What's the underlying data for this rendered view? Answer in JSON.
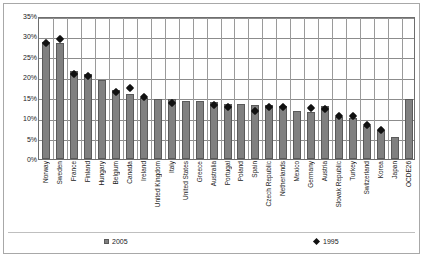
{
  "chart_data": {
    "type": "bar",
    "title": "",
    "xlabel": "",
    "ylabel": "",
    "ylim": [
      0,
      35
    ],
    "ytick_labels": [
      "0%",
      "5%",
      "10%",
      "15%",
      "20%",
      "25%",
      "30%",
      "35%"
    ],
    "ytick_values": [
      0,
      5,
      10,
      15,
      20,
      25,
      30,
      35
    ],
    "grid": true,
    "legend_position": "bottom",
    "categories": [
      "Norway",
      "Sweden",
      "France",
      "Finland",
      "Hungary",
      "Belgium",
      "Canada",
      "Ireland",
      "United Kingdom",
      "Italy",
      "United States",
      "Greece",
      "Australia",
      "Portugal",
      "Poland",
      "Spain",
      "Czech Republic",
      "Netherlands",
      "Mexico",
      "Germany",
      "Austria",
      "Slovak Republic",
      "Turkey",
      "Switzerland",
      "Korea",
      "Japan",
      "OCDE26"
    ],
    "series": [
      {
        "name": "2005",
        "type": "bar",
        "color": "#808080",
        "values": [
          28.7,
          28.4,
          21.5,
          20.9,
          19.3,
          17.0,
          15.8,
          14.9,
          14.7,
          14.7,
          14.2,
          14.2,
          13.9,
          13.5,
          13.5,
          13.2,
          13.1,
          13.0,
          11.8,
          11.4,
          13.0,
          10.2,
          10.1,
          8.2,
          7.0,
          5.5,
          14.8
        ]
      },
      {
        "name": "1995",
        "type": "scatter",
        "color": "#111111",
        "values": [
          29.0,
          29.8,
          21.4,
          20.8,
          null,
          16.8,
          17.9,
          15.6,
          null,
          14.3,
          null,
          null,
          13.7,
          13.3,
          null,
          12.2,
          13.3,
          13.2,
          null,
          12.9,
          12.7,
          11.0,
          11.0,
          8.8,
          7.6,
          null,
          null
        ]
      }
    ]
  },
  "legend": {
    "items": [
      {
        "label": "2005",
        "marker": "square",
        "color": "#808080"
      },
      {
        "label": "1995",
        "marker": "diamond",
        "color": "#111111"
      }
    ]
  }
}
